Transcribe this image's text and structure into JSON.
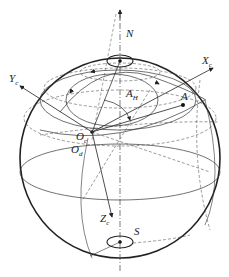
{
  "diagram": {
    "type": "celestial-sphere",
    "labels": {
      "north": "N",
      "south": "S",
      "point_a": "A",
      "angle": "A",
      "angle_sub": "H",
      "x_axis": "X",
      "x_sub": "c",
      "y_axis": "Y",
      "y_sub": "c",
      "z_axis": "Z",
      "z_sub": "c",
      "origin_c": "O",
      "origin_c_sub": "c",
      "origin_d": "O",
      "origin_d_sub": "d"
    },
    "colors": {
      "stroke": "#222222",
      "dashed": "#555555",
      "background": "#ffffff"
    }
  }
}
